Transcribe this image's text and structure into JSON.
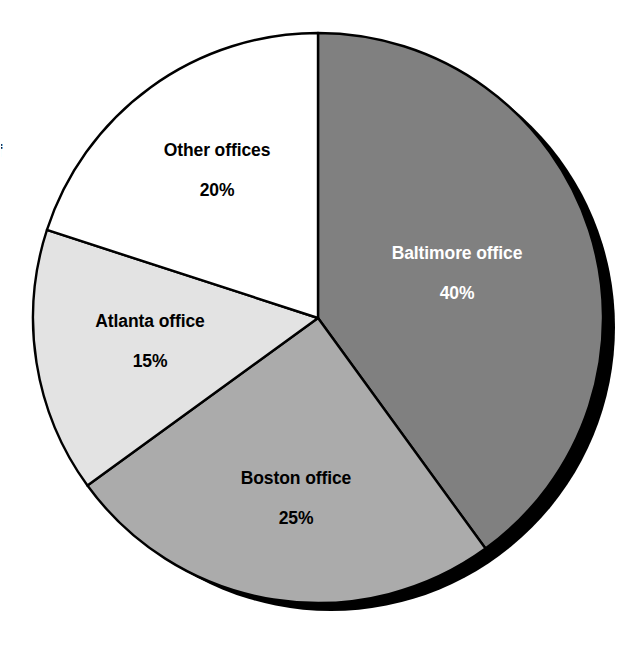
{
  "chart_data": {
    "type": "pie",
    "title": "",
    "subtitle": "",
    "xlabel": "",
    "ylabel": "",
    "legend_position": "none",
    "grid": false,
    "units": "percent",
    "total": 100,
    "start_angle_deg": 0,
    "direction": "clockwise",
    "categories": [
      "Baltimore office",
      "Boston office",
      "Atlanta office",
      "Other offices"
    ],
    "values": [
      40,
      25,
      15,
      20
    ],
    "value_labels": [
      "40%",
      "25%",
      "15%",
      "20%"
    ],
    "slices": [
      {
        "label": "Baltimore office",
        "value": 40,
        "value_label": "40%",
        "fill": "#808080",
        "stroke": "#000000",
        "text_color": "#ffffff",
        "start_deg": 0,
        "end_deg": 144
      },
      {
        "label": "Boston office",
        "value": 25,
        "value_label": "25%",
        "fill": "#ababab",
        "stroke": "#000000",
        "text_color": "#000000",
        "start_deg": 144,
        "end_deg": 234
      },
      {
        "label": "Atlanta office",
        "value": 15,
        "value_label": "15%",
        "fill": "#e3e3e3",
        "stroke": "#000000",
        "text_color": "#000000",
        "start_deg": 234,
        "end_deg": 288
      },
      {
        "label": "Other offices",
        "value": 20,
        "value_label": "20%",
        "fill": "#ffffff",
        "stroke": "#000000",
        "text_color": "#000000",
        "start_deg": 288,
        "end_deg": 360
      }
    ],
    "annotations": []
  },
  "style": {
    "background": "#ffffff",
    "shadow_color": "#000000",
    "outline_color": "#000000",
    "center_x": 318,
    "center_y": 318,
    "radius": 285,
    "shadow_offset_x": 13,
    "shadow_offset_y": 9
  },
  "artifacts": {
    "edge_glyph": "f"
  }
}
